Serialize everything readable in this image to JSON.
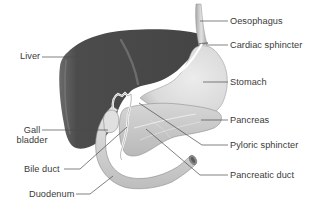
{
  "diagram": {
    "type": "anatomical-illustration",
    "colors": {
      "liver": "#4a4a4a",
      "stomach": "#dedede",
      "pancreas": "#c9c9c9",
      "duodenum": "#d8d8d8",
      "leader_line": "#4a4a4a",
      "text": "#3a3a3a",
      "background": "#ffffff"
    },
    "labels": {
      "liver": "Liver",
      "gall_bladder_line1": "Gall",
      "gall_bladder_line2": "bladder",
      "bile_duct": "Bile duct",
      "duodenum": "Duodenum",
      "oesophagus": "Oesophagus",
      "cardiac_sphincter": "Cardiac sphincter",
      "stomach": "Stomach",
      "pancreas": "Pancreas",
      "pyloric_sphincter": "Pyloric sphincter",
      "pancreatic_duct": "Pancreatic duct"
    }
  }
}
